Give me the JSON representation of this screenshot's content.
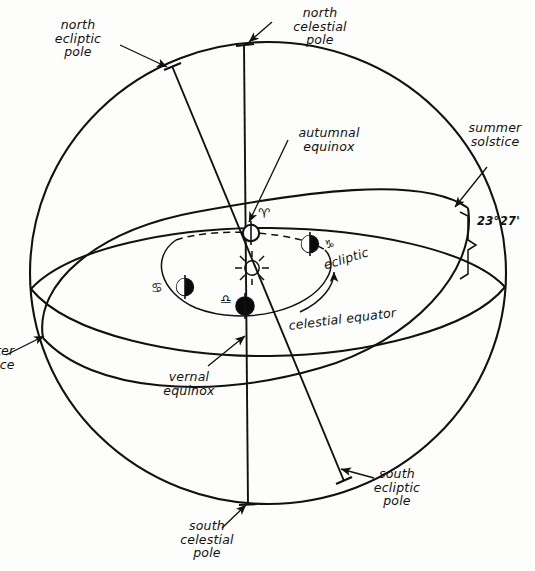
{
  "figure": {
    "type": "diagram",
    "title": ""
  },
  "labels": {
    "north_ecliptic_pole": "north\necliptic\npole",
    "north_celestial_pole": "north\ncelestial\npole",
    "autumnal_equinox": "autumnal\nequinox",
    "summer_solstice": "summer\nsolstice",
    "obliquity_angle": "23°27'",
    "ecliptic": "ecliptic",
    "celestial_equator": "celestial equator",
    "vernal_equinox": "vernal\nequinox",
    "winter_solstice_clipped": "ter\nice",
    "south_ecliptic_pole": "south\necliptic\npole",
    "south_celestial_pole": "south\ncelestial\npole"
  },
  "zodiac_symbols": {
    "aries": "♈",
    "capricorn": "♑",
    "cancer": "♋",
    "libra": "♎"
  },
  "bodies": {
    "sun": "sun-symbol",
    "earth_autumnal": "earth-open",
    "earth_capricorn": "earth-half",
    "earth_cancer": "earth-half",
    "earth_vernal": "earth-filled"
  },
  "colors": {
    "ink": "#111111",
    "paper": "#fdfdfb"
  }
}
